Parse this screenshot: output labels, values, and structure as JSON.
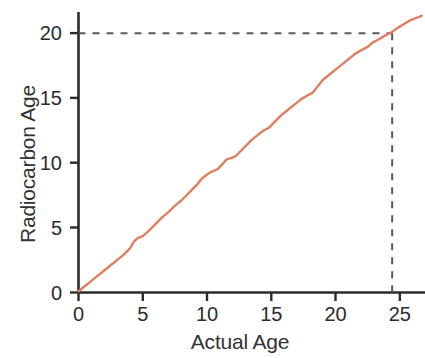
{
  "chart_data": {
    "type": "line",
    "title": "",
    "xlabel": "Actual Age",
    "ylabel": "Radiocarbon Age",
    "xlim": [
      0,
      27
    ],
    "ylim": [
      0,
      21.8
    ],
    "xticks": [
      0,
      5,
      10,
      15,
      20,
      25
    ],
    "yticks": [
      0,
      5,
      10,
      15,
      20
    ],
    "xtick_labels": [
      "0",
      "5",
      "10",
      "15",
      "20",
      "25"
    ],
    "ytick_labels": [
      "0",
      "5",
      "10",
      "15",
      "20"
    ],
    "grid": false,
    "legend": null,
    "line_color": "#df7f61",
    "axis_color": "#2b2b2b",
    "annotation_color": "#5a5a5a",
    "series": [
      {
        "name": "Calibration curve",
        "color": "#df7f61",
        "x": [
          0.0,
          0.5,
          1.0,
          1.5,
          2.0,
          2.5,
          3.0,
          3.5,
          4.0,
          4.3,
          4.6,
          5.0,
          5.5,
          6.0,
          6.5,
          7.0,
          7.5,
          8.0,
          8.5,
          8.8,
          9.2,
          9.6,
          10.0,
          10.4,
          10.8,
          11.2,
          11.5,
          11.8,
          12.2,
          12.6,
          13.0,
          13.5,
          14.0,
          14.4,
          14.8,
          15.3,
          15.8,
          16.3,
          16.8,
          17.3,
          17.8,
          18.2,
          18.6,
          19.0,
          19.5,
          20.0,
          20.5,
          21.0,
          21.5,
          22.0,
          22.5,
          22.9,
          23.3,
          23.8,
          24.3,
          24.8,
          25.3,
          25.8,
          26.3,
          26.7
        ],
        "y": [
          0.1,
          0.5,
          0.9,
          1.3,
          1.7,
          2.1,
          2.5,
          2.9,
          3.4,
          3.9,
          4.2,
          4.35,
          4.8,
          5.3,
          5.8,
          6.2,
          6.7,
          7.1,
          7.6,
          7.9,
          8.3,
          8.8,
          9.1,
          9.35,
          9.5,
          9.9,
          10.25,
          10.35,
          10.5,
          10.9,
          11.3,
          11.8,
          12.2,
          12.5,
          12.7,
          13.2,
          13.7,
          14.1,
          14.5,
          14.9,
          15.2,
          15.4,
          15.9,
          16.4,
          16.8,
          17.2,
          17.6,
          18.0,
          18.4,
          18.7,
          18.95,
          19.3,
          19.5,
          19.8,
          20.05,
          20.4,
          20.7,
          21.0,
          21.2,
          21.35
        ]
      }
    ],
    "annotations": [
      {
        "name": "horizontal-reference",
        "type": "dashed-line",
        "orientation": "horizontal",
        "value": 20,
        "from": 0,
        "to": 24.4,
        "color": "#5a5a5a"
      },
      {
        "name": "vertical-reference",
        "type": "dashed-line",
        "orientation": "vertical",
        "value": 24.4,
        "from": 0,
        "to": 20,
        "color": "#5a5a5a"
      }
    ]
  }
}
